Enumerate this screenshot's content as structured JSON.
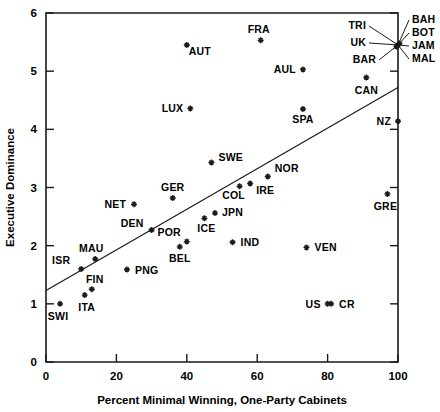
{
  "chart_data": {
    "type": "scatter",
    "title": "",
    "xlabel": "Percent Minimal Winning, One-Party Cabinets",
    "ylabel": "Executive Dominance",
    "xlim": [
      0,
      100
    ],
    "ylim": [
      0,
      6
    ],
    "xticks": [
      0,
      20,
      40,
      60,
      80,
      100
    ],
    "yticks": [
      0,
      1,
      2,
      3,
      4,
      5,
      6
    ],
    "grid": false,
    "legend": "none",
    "trend_line": {
      "x": [
        0,
        100
      ],
      "y": [
        1.23,
        4.72
      ]
    },
    "points": [
      {
        "label": "SWI",
        "x": 4,
        "y": 1.0,
        "lx": -2,
        "ly": 16,
        "anchor": "middle"
      },
      {
        "label": "ITA",
        "x": 11,
        "y": 1.15,
        "lx": 2,
        "ly": 16,
        "anchor": "middle"
      },
      {
        "label": "FIN",
        "x": 13,
        "y": 1.25,
        "lx": 3,
        "ly": -6,
        "anchor": "middle"
      },
      {
        "label": "ISR",
        "x": 10,
        "y": 1.6,
        "lx": -11,
        "ly": -5,
        "anchor": "end"
      },
      {
        "label": "MAU",
        "x": 14,
        "y": 1.77,
        "lx": -4,
        "ly": -7,
        "anchor": "middle"
      },
      {
        "label": "PNG",
        "x": 23,
        "y": 1.59,
        "lx": 8,
        "ly": 4,
        "anchor": "start"
      },
      {
        "label": "NET",
        "x": 25,
        "y": 2.71,
        "lx": -8,
        "ly": 4,
        "anchor": "end"
      },
      {
        "label": "DEN",
        "x": 30,
        "y": 2.27,
        "lx": -8,
        "ly": -3,
        "anchor": "end"
      },
      {
        "label": "GER",
        "x": 36,
        "y": 2.82,
        "lx": 0,
        "ly": -7,
        "anchor": "middle"
      },
      {
        "label": "BEL",
        "x": 38,
        "y": 1.98,
        "lx": 0,
        "ly": 15,
        "anchor": "middle"
      },
      {
        "label": "POR",
        "x": 40,
        "y": 2.07,
        "lx": -6,
        "ly": -6,
        "anchor": "end"
      },
      {
        "label": "AUT",
        "x": 40,
        "y": 5.45,
        "lx": 2,
        "ly": 10,
        "anchor": "start"
      },
      {
        "label": "LUX",
        "x": 41,
        "y": 4.36,
        "lx": -7,
        "ly": 4,
        "anchor": "end"
      },
      {
        "label": "ICE",
        "x": 45,
        "y": 2.47,
        "lx": 2,
        "ly": 14,
        "anchor": "middle"
      },
      {
        "label": "SWE",
        "x": 47,
        "y": 3.43,
        "lx": 7,
        "ly": -1,
        "anchor": "start"
      },
      {
        "label": "JPN",
        "x": 48,
        "y": 2.56,
        "lx": 7,
        "ly": 3,
        "anchor": "start"
      },
      {
        "label": "IND",
        "x": 53,
        "y": 2.06,
        "lx": 8,
        "ly": 4,
        "anchor": "start"
      },
      {
        "label": "COL",
        "x": 55,
        "y": 3.02,
        "lx": -6,
        "ly": 13,
        "anchor": "middle"
      },
      {
        "label": "IRE",
        "x": 58,
        "y": 3.07,
        "lx": 6,
        "ly": 11,
        "anchor": "start"
      },
      {
        "label": "FRA",
        "x": 61,
        "y": 5.53,
        "lx": -2,
        "ly": -7,
        "anchor": "middle"
      },
      {
        "label": "NOR",
        "x": 63,
        "y": 3.19,
        "lx": 7,
        "ly": -4,
        "anchor": "start"
      },
      {
        "label": "AUL",
        "x": 73,
        "y": 5.03,
        "lx": -7,
        "ly": 4,
        "anchor": "end"
      },
      {
        "label": "SPA",
        "x": 73,
        "y": 4.35,
        "lx": 0,
        "ly": 14,
        "anchor": "middle"
      },
      {
        "label": "VEN",
        "x": 74,
        "y": 1.97,
        "lx": 8,
        "ly": 4,
        "anchor": "start"
      },
      {
        "label": "US",
        "x": 80,
        "y": 1.0,
        "lx": -7,
        "ly": 4,
        "anchor": "end"
      },
      {
        "label": "CAN",
        "x": 91,
        "y": 4.89,
        "lx": 0,
        "ly": 16,
        "anchor": "middle"
      },
      {
        "label": "CR",
        "x": 81,
        "y": 1.0,
        "lx": 8,
        "ly": 4,
        "anchor": "start"
      },
      {
        "label": "GRE",
        "x": 97,
        "y": 2.89,
        "lx": -2,
        "ly": 16,
        "anchor": "middle"
      },
      {
        "label": "NZ",
        "x": 100,
        "y": 4.14,
        "lx": -7,
        "ly": 4,
        "anchor": "end"
      }
    ],
    "cluster": {
      "x": 100,
      "y": 5.45,
      "note": "Five overlapping points at the same coordinates, labelled with leader lines",
      "labels": [
        {
          "label": "TRI",
          "lx": -32,
          "ly": -16,
          "anchor": "end"
        },
        {
          "label": "UK",
          "lx": -32,
          "ly": 1,
          "anchor": "end"
        },
        {
          "label": "BAR",
          "lx": -22,
          "ly": 18,
          "anchor": "end"
        },
        {
          "label": "BAH",
          "lx": 14,
          "ly": -22,
          "anchor": "start"
        },
        {
          "label": "BOT",
          "lx": 14,
          "ly": -9,
          "anchor": "start"
        },
        {
          "label": "JAM",
          "lx": 14,
          "ly": 4,
          "anchor": "start"
        },
        {
          "label": "MAL",
          "lx": 14,
          "ly": 17,
          "anchor": "start"
        }
      ]
    }
  }
}
